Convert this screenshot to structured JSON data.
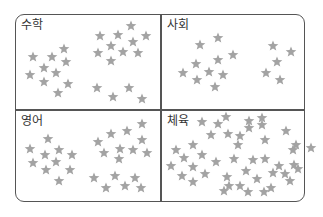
{
  "colors": {
    "star": "#a3a3a3",
    "border": "#555555",
    "label": "#333333"
  },
  "quadrants": [
    {
      "id": "math",
      "label": "수학",
      "label_pos": [
        21,
        17
      ],
      "star_count": 24,
      "stars": [
        [
          33,
          57
        ],
        [
          52,
          57
        ],
        [
          64,
          49
        ],
        [
          44,
          68
        ],
        [
          66,
          62
        ],
        [
          30,
          75
        ],
        [
          44,
          82
        ],
        [
          56,
          73
        ],
        [
          68,
          84
        ],
        [
          58,
          93
        ],
        [
          100,
          36
        ],
        [
          118,
          35
        ],
        [
          131,
          26
        ],
        [
          146,
          36
        ],
        [
          111,
          46
        ],
        [
          133,
          42
        ],
        [
          98,
          53
        ],
        [
          123,
          52
        ],
        [
          138,
          53
        ],
        [
          111,
          61
        ],
        [
          97,
          88
        ],
        [
          113,
          97
        ],
        [
          129,
          88
        ],
        [
          142,
          99
        ]
      ]
    },
    {
      "id": "social",
      "label": "사회",
      "label_pos": [
        167,
        17
      ],
      "star_count": 15,
      "stars": [
        [
          200,
          45
        ],
        [
          218,
          38
        ],
        [
          233,
          55
        ],
        [
          218,
          60
        ],
        [
          196,
          64
        ],
        [
          183,
          73
        ],
        [
          209,
          72
        ],
        [
          223,
          75
        ],
        [
          197,
          80
        ],
        [
          215,
          87
        ],
        [
          273,
          46
        ],
        [
          291,
          52
        ],
        [
          277,
          62
        ],
        [
          266,
          73
        ],
        [
          280,
          80
        ]
      ]
    },
    {
      "id": "english",
      "label": "영어",
      "label_pos": [
        21,
        114
      ],
      "star_count": 26,
      "stars": [
        [
          48,
          139
        ],
        [
          30,
          149
        ],
        [
          45,
          155
        ],
        [
          59,
          150
        ],
        [
          72,
          155
        ],
        [
          33,
          163
        ],
        [
          56,
          162
        ],
        [
          46,
          170
        ],
        [
          70,
          170
        ],
        [
          59,
          181
        ],
        [
          98,
          142
        ],
        [
          111,
          134
        ],
        [
          127,
          131
        ],
        [
          142,
          124
        ],
        [
          104,
          153
        ],
        [
          120,
          149
        ],
        [
          142,
          140
        ],
        [
          133,
          150
        ],
        [
          147,
          153
        ],
        [
          119,
          159
        ],
        [
          94,
          178
        ],
        [
          106,
          188
        ],
        [
          115,
          176
        ],
        [
          125,
          186
        ],
        [
          135,
          178
        ],
        [
          141,
          188
        ]
      ]
    },
    {
      "id": "pe",
      "label": "체육",
      "label_pos": [
        167,
        114
      ],
      "star_count": 44,
      "stars": [
        [
          202,
          122
        ],
        [
          218,
          124
        ],
        [
          226,
          117
        ],
        [
          211,
          135
        ],
        [
          228,
          134
        ],
        [
          240,
          136
        ],
        [
          249,
          121
        ],
        [
          249,
          128
        ],
        [
          262,
          118
        ],
        [
          262,
          125
        ],
        [
          265,
          140
        ],
        [
          286,
          131
        ],
        [
          176,
          150
        ],
        [
          193,
          145
        ],
        [
          184,
          158
        ],
        [
          202,
          155
        ],
        [
          171,
          166
        ],
        [
          193,
          167
        ],
        [
          182,
          176
        ],
        [
          205,
          174
        ],
        [
          193,
          182
        ],
        [
          216,
          162
        ],
        [
          234,
          159
        ],
        [
          227,
          177
        ],
        [
          229,
          186
        ],
        [
          240,
          186
        ],
        [
          253,
          160
        ],
        [
          246,
          171
        ],
        [
          257,
          179
        ],
        [
          265,
          159
        ],
        [
          273,
          173
        ],
        [
          264,
          192
        ],
        [
          248,
          192
        ],
        [
          285,
          174
        ],
        [
          293,
          150
        ],
        [
          294,
          165
        ],
        [
          296,
          145
        ],
        [
          298,
          169
        ],
        [
          290,
          181
        ],
        [
          271,
          188
        ],
        [
          224,
          191
        ],
        [
          238,
          145
        ],
        [
          279,
          166
        ],
        [
          311,
          148
        ]
      ]
    }
  ]
}
